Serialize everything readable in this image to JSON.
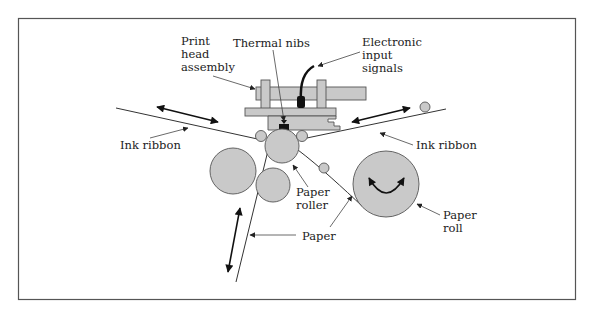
{
  "diagram": {
    "colors": {
      "part_fill": "#c9c9c9",
      "outline": "#555555",
      "ink": "#111111",
      "frame": "#555555"
    },
    "labels": {
      "print_head_assembly": [
        "Print",
        "head",
        "assembly"
      ],
      "thermal_nibs": "Thermal nibs",
      "electronic_input_signals": [
        "Electronic",
        "input",
        "signals"
      ],
      "ink_ribbon_left": "Ink ribbon",
      "ink_ribbon_right": "Ink ribbon",
      "paper_roller": [
        "Paper",
        "roller"
      ],
      "paper": "Paper",
      "paper_roll": [
        "Paper",
        "roll"
      ]
    },
    "components": [
      "print-head-assembly",
      "thermal-nibs",
      "signal-cable",
      "ink-ribbon-supply",
      "ink-ribbon-takeup",
      "paper-roller",
      "pinch-rollers",
      "guide-rollers",
      "paper-roll",
      "paper-path"
    ]
  }
}
